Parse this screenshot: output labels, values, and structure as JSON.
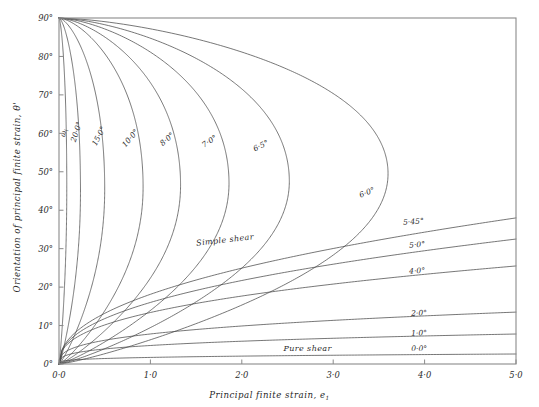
{
  "figure": {
    "background_color": "#ffffff",
    "line_color": "#4a4a4a",
    "frame_color": "#8a8a8a"
  },
  "axes": {
    "x": {
      "title": "Principal   finite   strain,  e",
      "title_subscript": "1",
      "ticks": [
        "0·0",
        "1·0",
        "2·0",
        "3·0",
        "4·0",
        "5·0"
      ],
      "tick_values": [
        0,
        1,
        2,
        3,
        4,
        5
      ],
      "range": [
        0,
        5
      ]
    },
    "y": {
      "title": "Orientation  of  principal  finite  strain,",
      "title_symbol": "θ'",
      "ticks": [
        "0°",
        "10°",
        "20°",
        "30°",
        "40°",
        "50°",
        "60°",
        "70°",
        "80°",
        "90°"
      ],
      "tick_values": [
        0,
        10,
        20,
        30,
        40,
        50,
        60,
        70,
        80,
        90
      ],
      "range": [
        0,
        90
      ]
    }
  },
  "region_labels": [
    {
      "name": "simple-shear",
      "text": "Simple   shear",
      "x": 1.82,
      "y": 31.6,
      "rotate": -6.5
    },
    {
      "name": "pure-shear",
      "text": "Pure   shear",
      "x": 2.72,
      "y": 3.4,
      "rotate": 0
    }
  ],
  "chart_data": {
    "type": "line",
    "title": "",
    "xlabel": "Principal finite strain, e1",
    "ylabel": "Orientation of principal finite strain, θ'",
    "xlim": [
      0,
      5
    ],
    "ylim": [
      0,
      90
    ],
    "grid": false,
    "legend": "inline-curve-labels",
    "note": "Deformation paths for general two-dimensional strain. Each curve is labelled with the value of the initial angle / kinematic parameter ωi in degrees. Looping curves (ωi >= 6·0°) start at (0, 90°), sweep right to a nose, and return to the origin (0, 0°). Monotonic curves (ωi <= 5·45°) rise from the origin toward the right-hand edge.",
    "series": [
      {
        "name": "ωi",
        "label": "ω",
        "label_subscript": "i",
        "type": "loop",
        "label_x": 0.075,
        "label_y": 60.0,
        "label_rotate": -78,
        "nose_x": 0.085,
        "nose_y": 46.0
      },
      {
        "name": "20·0°",
        "label": "20·0°",
        "type": "loop",
        "label_x": 0.215,
        "label_y": 60.2,
        "label_rotate": -72,
        "nose_x": 0.235,
        "nose_y": 45.0
      },
      {
        "name": "15·0°",
        "label": "15·0°",
        "type": "loop",
        "label_x": 0.46,
        "label_y": 59.0,
        "label_rotate": -62,
        "nose_x": 0.5,
        "nose_y": 45.5
      },
      {
        "name": "10·0°",
        "label": "10·0°",
        "type": "loop",
        "label_x": 0.8,
        "label_y": 58.3,
        "label_rotate": -50,
        "nose_x": 0.92,
        "nose_y": 46.0
      },
      {
        "name": "8·0°",
        "label": "8·0°",
        "type": "loop",
        "label_x": 1.2,
        "label_y": 58.0,
        "label_rotate": -42,
        "nose_x": 1.33,
        "nose_y": 46.5
      },
      {
        "name": "7·0°",
        "label": "7·0°",
        "type": "loop",
        "label_x": 1.66,
        "label_y": 57.4,
        "label_rotate": -33,
        "nose_x": 1.86,
        "nose_y": 47.0
      },
      {
        "name": "6·5°",
        "label": "6·5°",
        "type": "loop",
        "label_x": 2.22,
        "label_y": 56.2,
        "label_rotate": -26,
        "nose_x": 2.52,
        "nose_y": 47.5
      },
      {
        "name": "6·0°",
        "label": "6·0°",
        "type": "loop",
        "label_x": 3.38,
        "label_y": 44.0,
        "label_rotate": -22,
        "nose_x": 3.6,
        "nose_y": 49.5
      },
      {
        "name": "5·45°",
        "label": "5·45°",
        "type": "open",
        "label_x": 3.88,
        "label_y": 36.4,
        "label_rotate": -4,
        "edge_y": 38.0
      },
      {
        "name": "5·0°",
        "label": "5·0°",
        "type": "open",
        "label_x": 3.92,
        "label_y": 30.4,
        "label_rotate": -4,
        "edge_y": 32.5
      },
      {
        "name": "4·0°",
        "label": "4·0°",
        "type": "open",
        "label_x": 3.92,
        "label_y": 23.6,
        "label_rotate": -3,
        "edge_y": 25.5
      },
      {
        "name": "2·0°",
        "label": "2·0°",
        "type": "open",
        "label_x": 3.94,
        "label_y": 12.6,
        "label_rotate": -2,
        "edge_y": 13.5
      },
      {
        "name": "1·0°",
        "label": "1·0°",
        "type": "open",
        "label_x": 3.94,
        "label_y": 7.4,
        "label_rotate": -2,
        "edge_y": 7.8
      },
      {
        "name": "0·0°",
        "label": "0·0°",
        "type": "open",
        "label_x": 3.94,
        "label_y": 3.4,
        "label_rotate": 0,
        "edge_y": 2.6
      }
    ]
  }
}
